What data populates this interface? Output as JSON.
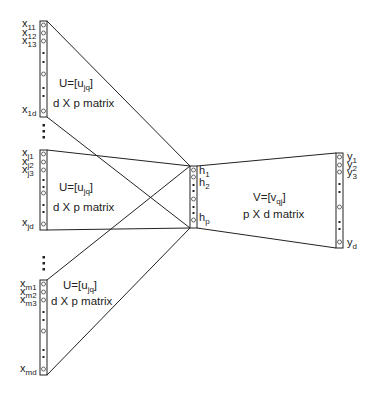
{
  "diagram": {
    "type": "neural-network-architecture",
    "stroke_color": "#222222",
    "input_groups": [
      {
        "id": "group-1",
        "nodes": [
          {
            "base": "x",
            "sub": "11"
          },
          {
            "base": "x",
            "sub": "12"
          },
          {
            "base": "x",
            "sub": "13"
          },
          {
            "base": "x",
            "sub": "1d"
          }
        ],
        "weight_label": {
          "prefix": "U=[u",
          "sub": "jq",
          "suffix": "]"
        },
        "dimension_label": "d X p matrix"
      },
      {
        "id": "group-j",
        "nodes": [
          {
            "base": "x",
            "sub": "j1"
          },
          {
            "base": "x",
            "sub": "j2"
          },
          {
            "base": "x",
            "sub": "j3"
          },
          {
            "base": "x",
            "sub": "jd"
          }
        ],
        "weight_label": {
          "prefix": "U=[u",
          "sub": "jq",
          "suffix": "]"
        },
        "dimension_label": "d X p matrix"
      },
      {
        "id": "group-m",
        "nodes": [
          {
            "base": "x",
            "sub": "m1"
          },
          {
            "base": "x",
            "sub": "m2"
          },
          {
            "base": "x",
            "sub": "m3"
          },
          {
            "base": "x",
            "sub": "md"
          }
        ],
        "weight_label": {
          "prefix": "U=[u",
          "sub": "jq",
          "suffix": "]"
        },
        "dimension_label": "d X p matrix"
      }
    ],
    "hidden_layer": {
      "nodes": [
        {
          "base": "h",
          "sub": "1"
        },
        {
          "base": "h",
          "sub": "2"
        },
        {
          "base": "h",
          "sub": "p"
        }
      ]
    },
    "output_layer": {
      "nodes": [
        {
          "base": "y",
          "sub": "1"
        },
        {
          "base": "y",
          "sub": "2"
        },
        {
          "base": "y",
          "sub": "3"
        },
        {
          "base": "y",
          "sub": "d"
        }
      ],
      "weight_label": {
        "prefix": "V=[v",
        "sub": "qj",
        "suffix": "]"
      },
      "dimension_label": "p X d matrix"
    }
  }
}
